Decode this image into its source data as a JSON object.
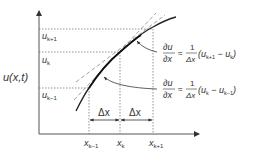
{
  "diagram": {
    "y_axis_label": "u(x,t)",
    "y_ticks": [
      {
        "label": "u",
        "sub": "k+1"
      },
      {
        "label": "u",
        "sub": "k"
      },
      {
        "label": "u",
        "sub": "k−1"
      }
    ],
    "x_ticks": [
      {
        "label": "x",
        "sub": "k−1"
      },
      {
        "label": "x",
        "sub": "k"
      },
      {
        "label": "x",
        "sub": "k+1"
      }
    ],
    "delta_labels": [
      "Δx",
      "Δx"
    ],
    "formulas": [
      {
        "lhs_num": "∂u",
        "lhs_den": "∂x",
        "approx": "≈",
        "frac_num": "1",
        "frac_den": "Δx",
        "paren_open": "(u",
        "sub1": "k+1",
        "minus": " − u",
        "sub2": "k",
        "paren_close": ")"
      },
      {
        "lhs_num": "∂u",
        "lhs_den": "∂x",
        "approx": "≈",
        "frac_num": "1",
        "frac_den": "Δx",
        "paren_open": "(u",
        "sub1": "k",
        "minus": " − u",
        "sub2": "k−1",
        "paren_close": ")"
      }
    ],
    "colors": {
      "axis": "#555555",
      "curve": "#222222",
      "dashed": "#888888",
      "text": "#333333"
    }
  }
}
